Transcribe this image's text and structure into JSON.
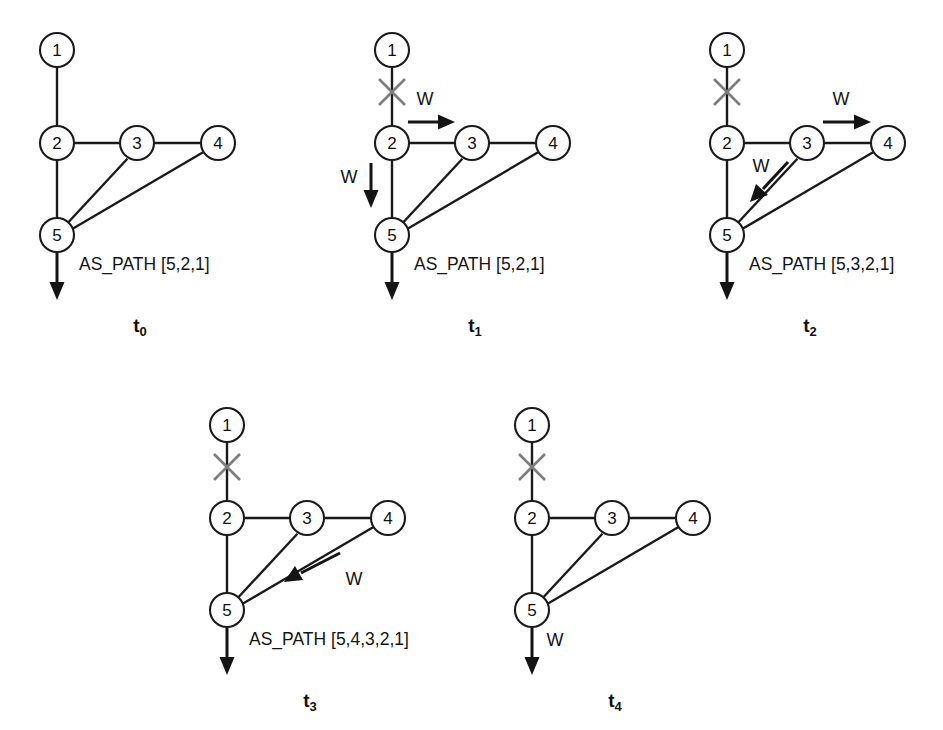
{
  "figure": {
    "background": "#ffffff",
    "ink_color": "#1a1a1a",
    "cut_marker_color": "#7e7e7e",
    "node_labels": [
      "1",
      "2",
      "3",
      "4",
      "5"
    ],
    "withdrawal_symbol": "W",
    "panels": [
      {
        "id": "t0",
        "time_label": "t",
        "time_subscript": "0",
        "as_path": "AS_PATH [5,2,1]",
        "link_failed": false,
        "withdrawals": []
      },
      {
        "id": "t1",
        "time_label": "t",
        "time_subscript": "1",
        "as_path": "AS_PATH [5,2,1]",
        "link_failed": true,
        "withdrawals": [
          {
            "from": "2",
            "to": "3",
            "label": "W",
            "direction": "right"
          },
          {
            "from": "2",
            "to": "5",
            "label": "W",
            "direction": "down"
          }
        ]
      },
      {
        "id": "t2",
        "time_label": "t",
        "time_subscript": "2",
        "as_path": "AS_PATH [5,3,2,1]",
        "link_failed": true,
        "withdrawals": [
          {
            "from": "3",
            "to": "4",
            "label": "W",
            "direction": "right"
          },
          {
            "from": "3",
            "to": "5",
            "label": "W",
            "direction": "down-left"
          }
        ]
      },
      {
        "id": "t3",
        "time_label": "t",
        "time_subscript": "3",
        "as_path": "AS_PATH [5,4,3,2,1]",
        "link_failed": true,
        "withdrawals": [
          {
            "from": "4",
            "to": "5",
            "label": "W",
            "direction": "down-left"
          }
        ]
      },
      {
        "id": "t4",
        "time_label": "t",
        "time_subscript": "4",
        "as_path": "",
        "egress_label": "W",
        "link_failed": true,
        "withdrawals": []
      }
    ],
    "topology": {
      "nodes": [
        {
          "id": "1",
          "x": 57,
          "y": 50
        },
        {
          "id": "2",
          "x": 57,
          "y": 143
        },
        {
          "id": "3",
          "x": 137,
          "y": 143
        },
        {
          "id": "4",
          "x": 218,
          "y": 143
        },
        {
          "id": "5",
          "x": 57,
          "y": 235
        }
      ],
      "edges": [
        {
          "a": "1",
          "b": "2"
        },
        {
          "a": "2",
          "b": "3"
        },
        {
          "a": "3",
          "b": "4"
        },
        {
          "a": "2",
          "b": "5"
        },
        {
          "a": "3",
          "b": "5"
        },
        {
          "a": "4",
          "b": "5"
        }
      ]
    }
  }
}
